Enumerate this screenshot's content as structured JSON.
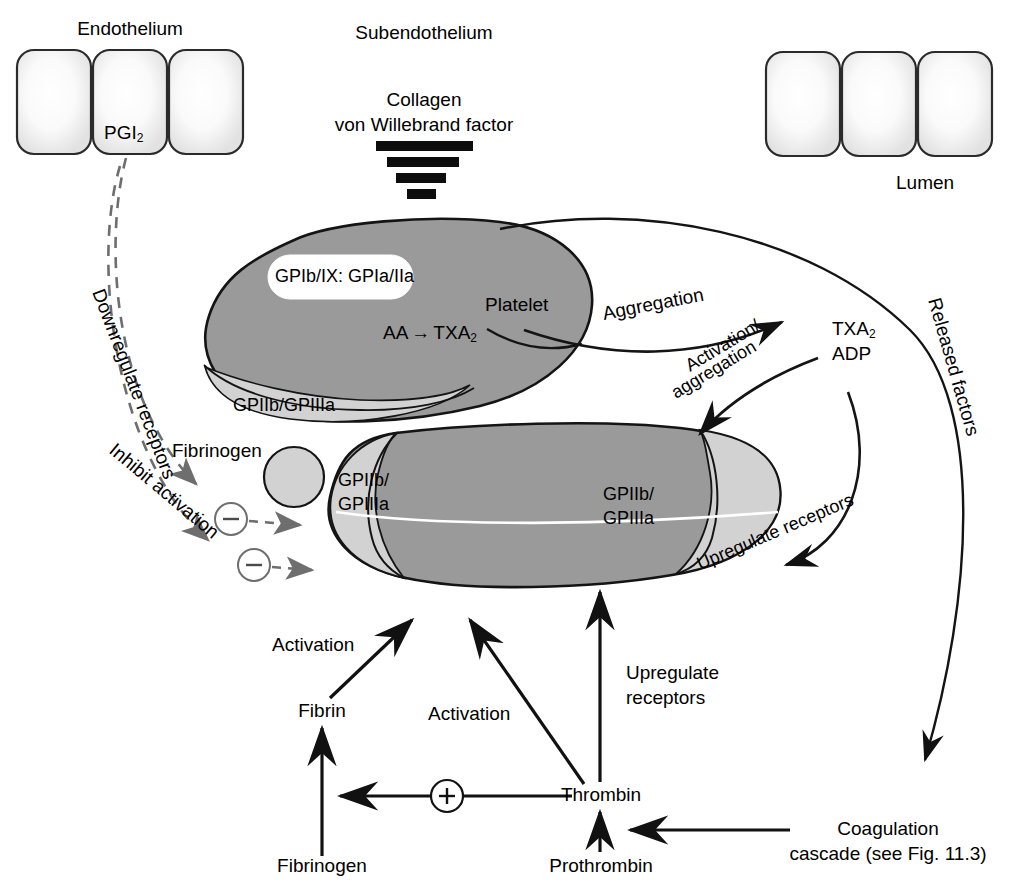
{
  "figure": {
    "reference_note": "see Fig. 11.3"
  },
  "colors": {
    "platelet_body": "#9a9a9a",
    "receptor_light": "#d2d2d2",
    "endothelium_fill": "#ececec",
    "outline": "#1a1a1a",
    "dashed_gray": "#6e6e6e",
    "background": "#ffffff"
  },
  "top_labels": {
    "endothelium": "Endothelium",
    "subendothelium": "Subendothelium",
    "lumen": "Lumen"
  },
  "endothelium_left": {
    "cell_count": 3,
    "mediator": "PGI",
    "mediator_sub": "2"
  },
  "endothelium_right": {
    "cell_count": 3
  },
  "subendothelium": {
    "line1": "Collagen",
    "line2": "von Willebrand factor",
    "bar_count": 4
  },
  "platelet_upper": {
    "name": "Platelet",
    "adhesion_receptors": "GPIb/IX: GPIa/IIa",
    "synthesis": "AA",
    "synthesis_arrow": "→",
    "synthesis_product": "TXA",
    "synthesis_product_sub": "2",
    "aggregation_receptor": "GPIIb/GPIIIa"
  },
  "platelet_lower": {
    "receptor_left_line1": "GPIIb/",
    "receptor_left_line2": "GPIIIa",
    "receptor_right_line1": "GPIIb/",
    "receptor_right_line2": "GPIIIa"
  },
  "fibrinogen_bridge": {
    "label": "Fibrinogen"
  },
  "mediators": {
    "line1": "TXA",
    "line1_sub": "2",
    "line2": "ADP"
  },
  "pathways": {
    "aggregation": "Aggregation",
    "released_factors": "Released factors",
    "activation_aggregation_line1": "Activation/",
    "activation_aggregation_line2": "aggregation",
    "upregulate_receptors_curve": "Upregulate receptors",
    "downregulate_receptors": "Downregulate receptors",
    "inhibit_activation": "Inhibit activation"
  },
  "signs": {
    "plus": "+",
    "minus": "−"
  },
  "bottom_cascade": {
    "activation_left": "Activation",
    "activation_mid": "Activation",
    "upregulate_line1": "Upregulate",
    "upregulate_line2": "receptors",
    "fibrin": "Fibrin",
    "fibrinogen": "Fibrinogen",
    "thrombin": "Thrombin",
    "prothrombin": "Prothrombin",
    "coagulation_line1": "Coagulation",
    "coagulation_line2": "cascade (see Fig. 11.3)"
  }
}
